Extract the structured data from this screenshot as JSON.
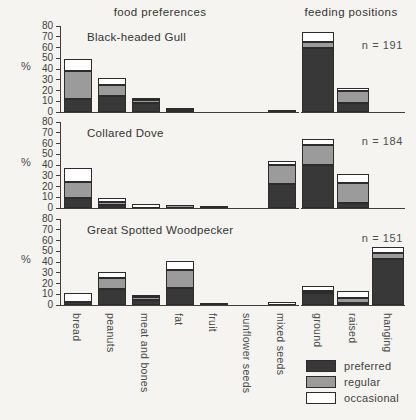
{
  "titles": {
    "left": "food preferences",
    "right": "feeding positions"
  },
  "percent_sign": "%",
  "legend": [
    {
      "label": "preferred",
      "color": "#383838"
    },
    {
      "label": "regular",
      "color": "#9b9b9b"
    },
    {
      "label": "occasional",
      "color": "#ffffff"
    }
  ],
  "chart_data": {
    "type": "bar",
    "stacked": true,
    "ylabel": "%",
    "ylim": [
      0,
      80
    ],
    "yticks": [
      80,
      70,
      60,
      50,
      40,
      30,
      20,
      10,
      0
    ],
    "series_names": [
      "preferred",
      "regular",
      "occasional"
    ],
    "series_colors": {
      "preferred": "#383838",
      "regular": "#9b9b9b",
      "occasional": "#ffffff"
    },
    "food_categories": [
      "bread",
      "peanuts",
      "meat and bones",
      "fat",
      "fruit",
      "sunflower seeds",
      "mixed seeds"
    ],
    "position_categories": [
      "ground",
      "raised",
      "hanging"
    ],
    "panels": [
      {
        "species": "Black-headed Gull",
        "n": 191,
        "n_label": "n = 191",
        "food": {
          "preferred": [
            12,
            15,
            8,
            1,
            0,
            0,
            0
          ],
          "regular": [
            26,
            10,
            3,
            2,
            0,
            0,
            0
          ],
          "occasional": [
            11,
            7,
            2,
            0,
            0,
            0,
            2
          ]
        },
        "positions": {
          "preferred": [
            60,
            8,
            0
          ],
          "regular": [
            5,
            12,
            0
          ],
          "occasional": [
            9,
            2,
            0
          ]
        }
      },
      {
        "species": "Collared Dove",
        "n": 184,
        "n_label": "n = 184",
        "food": {
          "preferred": [
            9,
            3,
            0,
            0,
            2,
            0,
            22
          ],
          "regular": [
            15,
            3,
            0,
            3,
            0,
            0,
            18
          ],
          "occasional": [
            13,
            3,
            4,
            0,
            0,
            0,
            4
          ]
        },
        "positions": {
          "preferred": [
            40,
            5,
            0
          ],
          "regular": [
            19,
            18,
            0
          ],
          "occasional": [
            5,
            9,
            0
          ]
        }
      },
      {
        "species": "Great Spotted Woodpecker",
        "n": 151,
        "n_label": "n = 151",
        "food": {
          "preferred": [
            3,
            15,
            5,
            16,
            2,
            0,
            0
          ],
          "regular": [
            0,
            10,
            2,
            17,
            0,
            0,
            0
          ],
          "occasional": [
            8,
            6,
            2,
            8,
            0,
            0,
            3
          ]
        },
        "positions": {
          "preferred": [
            11,
            1,
            43
          ],
          "regular": [
            1,
            5,
            5
          ],
          "occasional": [
            5,
            6,
            6
          ]
        }
      }
    ]
  }
}
